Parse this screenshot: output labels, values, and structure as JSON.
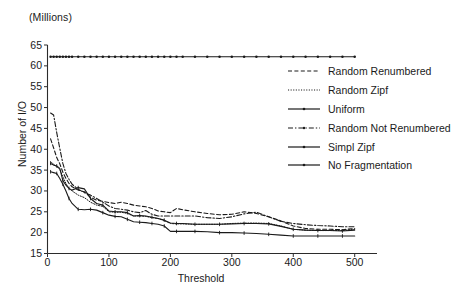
{
  "chart_data": {
    "type": "line",
    "title": "",
    "units_note": "(Millions)",
    "xlabel": "Threshold",
    "ylabel": "Number of I/O",
    "xlim": [
      0,
      520
    ],
    "ylim": [
      15,
      65
    ],
    "xticks": [
      0,
      100,
      200,
      300,
      400,
      500
    ],
    "yticks": [
      15,
      20,
      25,
      30,
      35,
      40,
      45,
      50,
      55,
      60,
      65
    ],
    "grid": false,
    "legend_position": "upper-right-inside",
    "x": [
      5,
      10,
      15,
      20,
      25,
      30,
      35,
      40,
      50,
      60,
      70,
      80,
      90,
      100,
      110,
      120,
      130,
      140,
      150,
      160,
      170,
      180,
      190,
      200,
      210,
      220,
      240,
      260,
      280,
      300,
      320,
      340,
      360,
      380,
      400,
      420,
      440,
      460,
      480,
      500
    ],
    "series": [
      {
        "name": "Random Renumbered",
        "style": "dashed",
        "marker": "none",
        "color": "#1a1a1a",
        "values": [
          42.5,
          40.3,
          38.0,
          36.5,
          34.5,
          33.0,
          31.8,
          31.0,
          30.2,
          29.8,
          28.5,
          27.8,
          27.5,
          27.2,
          27.0,
          27.3,
          27.0,
          26.6,
          26.4,
          26.2,
          25.8,
          25.2,
          25.0,
          24.8,
          25.8,
          25.5,
          25.0,
          24.6,
          24.3,
          24.4,
          25.0,
          24.6,
          23.8,
          22.8,
          21.6,
          21.0,
          20.8,
          20.8,
          20.7,
          21.0
        ]
      },
      {
        "name": "Random Zipf",
        "style": "dotted",
        "marker": "none",
        "color": "#1a1a1a",
        "values": [
          37.0,
          36.4,
          35.8,
          35.2,
          33.4,
          31.8,
          30.6,
          30.0,
          29.0,
          28.4,
          27.3,
          26.6,
          26.3,
          25.0,
          24.9,
          24.9,
          24.6,
          24.0,
          24.0,
          23.9,
          23.6,
          23.4,
          22.9,
          22.2,
          22.1,
          22.1,
          22.0,
          22.0,
          22.0,
          22.2,
          22.3,
          22.3,
          22.2,
          21.6,
          20.8,
          20.6,
          20.5,
          20.5,
          20.5,
          20.8
        ]
      },
      {
        "name": "Uniform",
        "style": "solid",
        "marker": "tick",
        "color": "#1a1a1a",
        "values": [
          36.6,
          36.2,
          36.0,
          35.4,
          32.5,
          31.4,
          30.6,
          30.2,
          30.8,
          30.5,
          28.2,
          27.0,
          26.6,
          25.2,
          25.0,
          25.0,
          24.8,
          24.0,
          24.1,
          24.0,
          23.7,
          23.4,
          23.0,
          22.3,
          22.2,
          22.2,
          22.0,
          22.0,
          22.0,
          22.1,
          22.2,
          22.2,
          22.1,
          21.5,
          20.8,
          20.6,
          20.5,
          20.5,
          20.4,
          20.6
        ]
      },
      {
        "name": "Random Not Renumbered",
        "style": "dashdot",
        "marker": "none",
        "color": "#1a1a1a",
        "values": [
          48.7,
          48.2,
          44.0,
          40.2,
          36.6,
          34.2,
          32.8,
          31.6,
          30.4,
          29.6,
          29.0,
          28.2,
          27.3,
          26.4,
          25.8,
          25.6,
          25.4,
          25.0,
          24.8,
          25.3,
          24.4,
          24.0,
          24.0,
          24.0,
          24.0,
          24.0,
          24.0,
          23.6,
          23.4,
          23.8,
          24.5,
          24.9,
          23.8,
          22.7,
          22.2,
          21.9,
          21.7,
          21.6,
          21.4,
          21.4
        ]
      },
      {
        "name": "Simpl Zipf",
        "style": "solid",
        "marker": "tick",
        "color": "#1a1a1a",
        "values": [
          34.6,
          34.4,
          34.2,
          33.0,
          31.6,
          30.0,
          28.2,
          27.0,
          25.6,
          25.5,
          25.6,
          25.4,
          24.8,
          24.2,
          23.9,
          23.8,
          23.2,
          22.6,
          22.5,
          22.4,
          22.2,
          22.0,
          21.6,
          20.3,
          20.3,
          20.3,
          20.3,
          20.2,
          20.0,
          20.0,
          19.9,
          19.8,
          19.6,
          19.4,
          19.2,
          19.2,
          19.2,
          19.2,
          19.2,
          19.2
        ]
      },
      {
        "name": "No Fragmentation",
        "style": "solid",
        "marker": "dot",
        "color": "#1a1a1a",
        "values": [
          62.2,
          62.2,
          62.2,
          62.2,
          62.2,
          62.2,
          62.2,
          62.2,
          62.2,
          62.2,
          62.2,
          62.2,
          62.2,
          62.2,
          62.2,
          62.2,
          62.2,
          62.2,
          62.2,
          62.2,
          62.2,
          62.2,
          62.2,
          62.2,
          62.2,
          62.2,
          62.2,
          62.2,
          62.2,
          62.2,
          62.2,
          62.2,
          62.2,
          62.2,
          62.2,
          62.2,
          62.2,
          62.2,
          62.2,
          62.2
        ]
      }
    ]
  }
}
